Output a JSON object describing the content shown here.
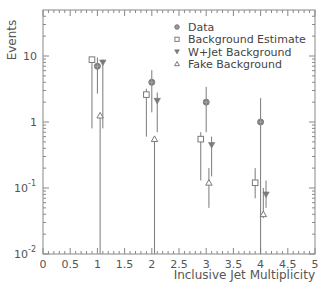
{
  "chart_data": {
    "type": "scatter",
    "title": "",
    "xlabel": "Inclusive Jet Multiplicity",
    "ylabel": "Events",
    "xlim": [
      0,
      5
    ],
    "ylim": [
      0.01,
      50
    ],
    "yscale": "log",
    "grid": false,
    "legend_position": "top-right",
    "x_ticks": [
      "0",
      "0.5",
      "1",
      "1.5",
      "2",
      "2.5",
      "3",
      "3.5",
      "4",
      "4.5",
      "5"
    ],
    "y_ticks": [
      {
        "value": 0.01,
        "label": "10",
        "exp": "-2"
      },
      {
        "value": 0.1,
        "label": "10",
        "exp": "-1"
      },
      {
        "value": 1,
        "label": "1",
        "exp": ""
      },
      {
        "value": 10,
        "label": "10",
        "exp": ""
      }
    ],
    "categories": [
      1,
      2,
      3,
      4
    ],
    "series": [
      {
        "name": "Data",
        "marker": "filled-circle",
        "x_offset": 0.0,
        "values": [
          7,
          4,
          2,
          1
        ],
        "err_low": [
          4.3,
          2.6,
          1.3,
          1.0
        ],
        "err_high": [
          9.5,
          6.1,
          3.4,
          2.3
        ]
      },
      {
        "name": "Background Estimate",
        "marker": "open-square",
        "x_offset": -0.1,
        "values": [
          8.8,
          2.6,
          0.55,
          0.12
        ],
        "err_low": [
          8.0,
          2.0,
          0.42,
          0.05
        ],
        "err_high": [
          9.6,
          3.2,
          0.7,
          0.2
        ]
      },
      {
        "name": "W+Jet Background",
        "marker": "filled-triangle-down",
        "x_offset": 0.1,
        "values": [
          8.0,
          2.1,
          0.45,
          0.08
        ],
        "err_low": [
          7.2,
          1.4,
          0.3,
          0.03
        ],
        "err_high": [
          8.8,
          2.8,
          0.6,
          0.13
        ]
      },
      {
        "name": "Fake Background",
        "marker": "open-triangle-up",
        "x_offset": 0.05,
        "values": [
          1.25,
          0.55,
          0.12,
          0.04
        ],
        "err_low": [
          1.25,
          0.55,
          0.07,
          0.005
        ],
        "err_high": [
          1.25,
          0.55,
          0.2,
          0.1
        ]
      }
    ]
  },
  "legend": {
    "items": [
      {
        "label": "Data",
        "marker": "filled-circle"
      },
      {
        "label": "Background Estimate",
        "marker": "open-square"
      },
      {
        "label": "W+Jet Background",
        "marker": "filled-triangle-down"
      },
      {
        "label": "Fake Background",
        "marker": "open-triangle-up"
      }
    ]
  },
  "colors": {
    "axis": "#888888",
    "marker": "#7a7a7a",
    "text": "#555555"
  }
}
